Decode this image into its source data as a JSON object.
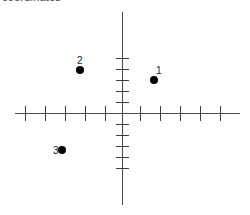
{
  "figure": {
    "title": "coordinates",
    "background_color": "#ffffff",
    "axis_color": "#4a4a4a",
    "tick_color": "#3d3d3d",
    "point_color": "#000000",
    "label_color": "#1a1a1a"
  },
  "chart_data": {
    "type": "scatter",
    "title": "coordinates",
    "xlabel": "",
    "ylabel": "",
    "grid": false,
    "legend": null,
    "axes": {
      "origin_px": [
        122,
        113
      ],
      "x_axis": {
        "start_px": 15,
        "end_px": 240,
        "tick_spacing_px": 20,
        "ticks_left": 5,
        "ticks_right": 5,
        "xlim": [
          -5,
          5
        ]
      },
      "y_axis": {
        "start_px": 12,
        "end_px": 205,
        "tick_spacing_px": 11,
        "ticks_above": 5,
        "ticks_below": 5,
        "ylim": [
          -5,
          5
        ]
      }
    },
    "x_ticks": [
      -5,
      -4,
      -3,
      -2,
      -1,
      1,
      2,
      3,
      4,
      5
    ],
    "y_ticks": [
      5,
      4,
      3,
      2,
      1,
      -1,
      -2,
      -3,
      -4,
      -5
    ],
    "points": [
      {
        "label": "1",
        "x": 1.6,
        "y": 3.0,
        "px": 154,
        "py": 80,
        "label_px": 156,
        "label_py": 66,
        "label_position": "above-right"
      },
      {
        "label": "2",
        "x": -2.1,
        "y": 3.9,
        "px": 80,
        "py": 70,
        "label_px": 77,
        "label_py": 56,
        "label_position": "above"
      },
      {
        "label": "3",
        "x": -3.0,
        "y": -3.4,
        "px": 62,
        "py": 150,
        "label_px": 53,
        "label_py": 146,
        "label_position": "left"
      }
    ]
  },
  "vertical_ticks_px": [
    58,
    69,
    80,
    91,
    102,
    124,
    135,
    146,
    157,
    168
  ],
  "horizontal_ticks_px": [
    25,
    45,
    65,
    85,
    105,
    140,
    160,
    180,
    200,
    220
  ]
}
